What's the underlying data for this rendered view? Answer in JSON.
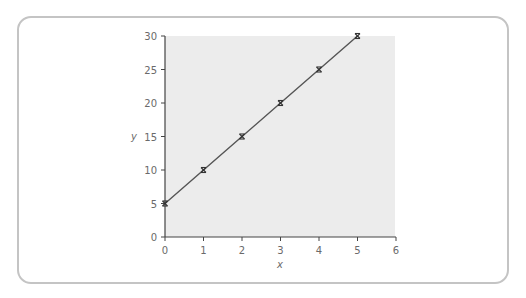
{
  "chart_data": {
    "type": "line",
    "title": "",
    "xlabel": "x",
    "ylabel": "y",
    "xlim": [
      0,
      6
    ],
    "ylim": [
      0,
      30
    ],
    "x_ticks": [
      "0",
      "1",
      "2",
      "3",
      "4",
      "5",
      "6"
    ],
    "y_ticks": [
      "0",
      "5",
      "10",
      "15",
      "20",
      "25",
      "30"
    ],
    "grid": false,
    "legend": null,
    "series": [
      {
        "name": "data",
        "x": [
          0,
          1,
          2,
          3,
          4,
          5
        ],
        "y": [
          5,
          10,
          15,
          20,
          25,
          30
        ],
        "marker": "x",
        "color": "#555555"
      }
    ],
    "plot_background": "#ececec"
  },
  "labels": {
    "x_axis": "x",
    "y_axis": "y",
    "x_ticks": [
      "0",
      "1",
      "2",
      "3",
      "4",
      "5",
      "6"
    ],
    "y_ticks": [
      "0",
      "5",
      "10",
      "15",
      "20",
      "25",
      "30"
    ]
  }
}
